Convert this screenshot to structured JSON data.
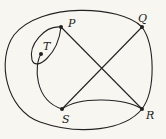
{
  "diagram": {
    "type": "graph",
    "vertices": [
      {
        "id": "P",
        "label": "P",
        "x": 61,
        "y": 27
      },
      {
        "id": "Q",
        "label": "Q",
        "x": 142,
        "y": 27
      },
      {
        "id": "T",
        "label": "T",
        "x": 41,
        "y": 54
      },
      {
        "id": "S",
        "label": "S",
        "x": 62,
        "y": 109
      },
      {
        "id": "R",
        "label": "R",
        "x": 142,
        "y": 109
      }
    ],
    "edges": [
      {
        "from": "P",
        "to": "R",
        "shape": "straight"
      },
      {
        "from": "S",
        "to": "Q",
        "shape": "straight"
      },
      {
        "from": "S",
        "to": "R",
        "shape": "curved"
      },
      {
        "from": "Q",
        "to": "R",
        "shape": "curved"
      },
      {
        "from": "P",
        "to": "P",
        "shape": "loop"
      },
      {
        "from": "T",
        "to": "S",
        "shape": "curved"
      },
      {
        "from": "Q",
        "to": "R",
        "shape": "outer-curve"
      }
    ],
    "colors": {
      "line": "#222222",
      "background": "#f7f6f1"
    }
  }
}
